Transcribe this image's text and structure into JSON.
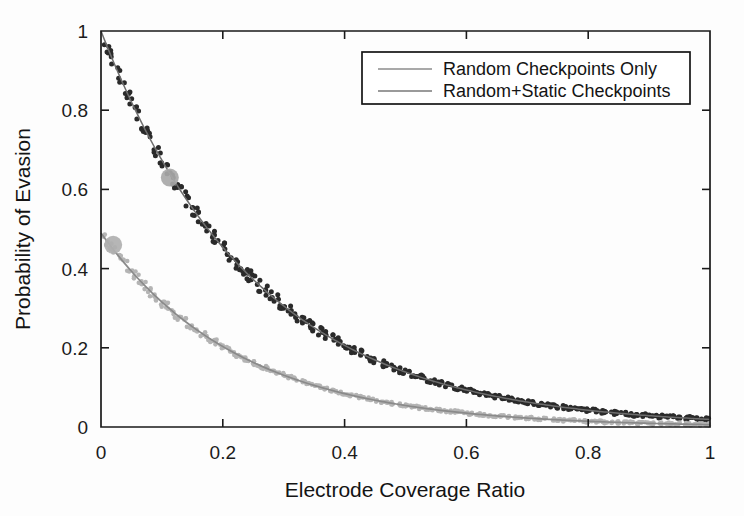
{
  "chart_data": {
    "type": "scatter",
    "title": "",
    "xlabel": "Electrode Coverage Ratio",
    "ylabel": "Probability of Evasion",
    "xlim": [
      0,
      1
    ],
    "ylim": [
      0,
      1
    ],
    "xticks": [
      0,
      0.2,
      0.4,
      0.6,
      0.8,
      1
    ],
    "yticks": [
      0,
      0.2,
      0.4,
      0.6,
      0.8,
      1
    ],
    "xticklabels": [
      "0",
      "0.2",
      "0.4",
      "0.6",
      "0.8",
      "1"
    ],
    "yticklabels": [
      "0",
      "0.2",
      "0.4",
      "0.6",
      "0.8",
      "1"
    ],
    "grid": false,
    "legend_position": "top-right",
    "series": [
      {
        "name": "Random Checkpoints Only",
        "marker_color": "#2a2a2a",
        "fit_color": "#6d6d6d",
        "fit_model": "exponential",
        "fit_amplitude": 1.0,
        "fit_rate": 3.95,
        "noise_scale": 0.018,
        "x": [
          0.0,
          0.01,
          0.02,
          0.03,
          0.04,
          0.05,
          0.06,
          0.07,
          0.08,
          0.09,
          0.1,
          0.11,
          0.12,
          0.13,
          0.14,
          0.15,
          0.16,
          0.17,
          0.18,
          0.19,
          0.2,
          0.21,
          0.22,
          0.23,
          0.24,
          0.25,
          0.26,
          0.27,
          0.28,
          0.29,
          0.3,
          0.31,
          0.32,
          0.33,
          0.34,
          0.35,
          0.36,
          0.37,
          0.38,
          0.39,
          0.4,
          0.41,
          0.42,
          0.43,
          0.44,
          0.45,
          0.46,
          0.47,
          0.48,
          0.49,
          0.5,
          0.51,
          0.52,
          0.53,
          0.54,
          0.55,
          0.56,
          0.57,
          0.58,
          0.59,
          0.6,
          0.61,
          0.62,
          0.63,
          0.64,
          0.65,
          0.66,
          0.67,
          0.68,
          0.69,
          0.7,
          0.71,
          0.72,
          0.73,
          0.74,
          0.75,
          0.76,
          0.77,
          0.78,
          0.79,
          0.8,
          0.81,
          0.82,
          0.83,
          0.84,
          0.85,
          0.86,
          0.87,
          0.88,
          0.89,
          0.9,
          0.91,
          0.92,
          0.93,
          0.94,
          0.95,
          0.96,
          0.97,
          0.98,
          0.99,
          1.0
        ],
        "y": [
          1.0,
          0.964,
          0.928,
          0.889,
          0.861,
          0.826,
          0.797,
          0.762,
          0.735,
          0.702,
          0.678,
          0.651,
          0.628,
          0.608,
          0.589,
          0.561,
          0.542,
          0.523,
          0.501,
          0.482,
          0.467,
          0.451,
          0.436,
          0.418,
          0.401,
          0.388,
          0.374,
          0.361,
          0.348,
          0.335,
          0.322,
          0.311,
          0.299,
          0.289,
          0.279,
          0.268,
          0.259,
          0.249,
          0.241,
          0.232,
          0.224,
          0.216,
          0.209,
          0.201,
          0.194,
          0.187,
          0.181,
          0.174,
          0.168,
          0.162,
          0.157,
          0.151,
          0.146,
          0.141,
          0.136,
          0.131,
          0.126,
          0.122,
          0.118,
          0.114,
          0.11,
          0.106,
          0.102,
          0.099,
          0.095,
          0.092,
          0.089,
          0.086,
          0.083,
          0.08,
          0.077,
          0.074,
          0.072,
          0.069,
          0.067,
          0.065,
          0.062,
          0.06,
          0.058,
          0.056,
          0.054,
          0.052,
          0.05,
          0.049,
          0.047,
          0.045,
          0.044,
          0.042,
          0.041,
          0.039,
          0.038,
          0.037,
          0.035,
          0.034,
          0.033,
          0.032,
          0.031,
          0.03,
          0.029,
          0.028,
          0.027
        ]
      },
      {
        "name": "Random+Static Checkpoints",
        "marker_color": "#b4b4b4",
        "fit_color": "#8a8a8a",
        "fit_model": "exponential",
        "fit_amplitude": 0.49,
        "fit_rate": 4.4,
        "noise_scale": 0.014,
        "x": [
          0.0,
          0.01,
          0.02,
          0.03,
          0.04,
          0.05,
          0.06,
          0.07,
          0.08,
          0.09,
          0.1,
          0.11,
          0.12,
          0.13,
          0.14,
          0.15,
          0.16,
          0.17,
          0.18,
          0.19,
          0.2,
          0.21,
          0.22,
          0.23,
          0.24,
          0.25,
          0.26,
          0.27,
          0.28,
          0.29,
          0.3,
          0.31,
          0.32,
          0.33,
          0.34,
          0.35,
          0.36,
          0.37,
          0.38,
          0.39,
          0.4,
          0.41,
          0.42,
          0.43,
          0.44,
          0.45,
          0.46,
          0.47,
          0.48,
          0.49,
          0.5,
          0.51,
          0.52,
          0.53,
          0.54,
          0.55,
          0.56,
          0.57,
          0.58,
          0.59,
          0.6,
          0.61,
          0.62,
          0.63,
          0.64,
          0.65,
          0.66,
          0.67,
          0.68,
          0.69,
          0.7,
          0.71,
          0.72,
          0.73,
          0.74,
          0.75,
          0.76,
          0.77,
          0.78,
          0.79,
          0.8,
          0.81,
          0.82,
          0.83,
          0.84,
          0.85,
          0.86,
          0.87,
          0.88,
          0.89,
          0.9,
          0.91,
          0.92,
          0.93,
          0.94,
          0.95,
          0.96,
          0.97,
          0.98,
          0.99,
          1.0
        ],
        "y": [
          0.49,
          0.469,
          0.449,
          0.429,
          0.411,
          0.393,
          0.376,
          0.36,
          0.344,
          0.329,
          0.315,
          0.302,
          0.289,
          0.276,
          0.264,
          0.253,
          0.242,
          0.232,
          0.222,
          0.212,
          0.203,
          0.194,
          0.186,
          0.178,
          0.17,
          0.163,
          0.156,
          0.149,
          0.143,
          0.137,
          0.131,
          0.125,
          0.12,
          0.115,
          0.11,
          0.105,
          0.1,
          0.096,
          0.092,
          0.088,
          0.084,
          0.08,
          0.077,
          0.074,
          0.07,
          0.067,
          0.064,
          0.062,
          0.059,
          0.056,
          0.054,
          0.052,
          0.049,
          0.047,
          0.045,
          0.043,
          0.041,
          0.04,
          0.038,
          0.036,
          0.035,
          0.033,
          0.032,
          0.03,
          0.029,
          0.028,
          0.027,
          0.026,
          0.024,
          0.023,
          0.022,
          0.021,
          0.021,
          0.02,
          0.019,
          0.018,
          0.017,
          0.017,
          0.016,
          0.015,
          0.015,
          0.014,
          0.013,
          0.013,
          0.012,
          0.012,
          0.011,
          0.011,
          0.01,
          0.01,
          0.009,
          0.009,
          0.009,
          0.008,
          0.008,
          0.008,
          0.007,
          0.007,
          0.007,
          0.006,
          0.006
        ]
      }
    ],
    "highlight_markers": [
      {
        "name": "upper-curve-highlight",
        "x": 0.113,
        "y": 0.63,
        "color": "#a8a8a8",
        "radius": 9
      },
      {
        "name": "lower-curve-highlight",
        "x": 0.02,
        "y": 0.46,
        "color": "#b0b0b0",
        "radius": 9
      }
    ]
  },
  "legend": {
    "entries": [
      {
        "label": "Random Checkpoints Only",
        "color": "#8d8d8d"
      },
      {
        "label": "Random+Static Checkpoints",
        "color": "#9a9a9a"
      }
    ]
  }
}
